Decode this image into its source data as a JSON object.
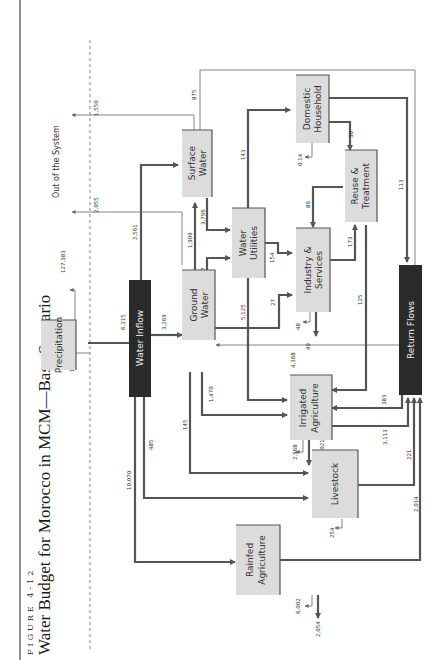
{
  "figure": {
    "label": "FIGURE 4-12",
    "title": "Water Budget for Morocco in MCM—Base Scenario"
  },
  "regions": {
    "out_of_system": "Out of the System"
  },
  "nodes": {
    "precipitation": "Precipitation",
    "water_inflow": "Water Inflow",
    "surface_water": [
      "Surface",
      "Water"
    ],
    "ground_water": [
      "Ground",
      "Water"
    ],
    "water_utilities": [
      "Water",
      "Utilities"
    ],
    "domestic_household": [
      "Domestic",
      "Household"
    ],
    "reuse_treatment": [
      "Reuse &",
      "Treatment"
    ],
    "industry_services": [
      "Industry &",
      "Services"
    ],
    "irrigated_agriculture": [
      "Irrigated",
      "Agriculture"
    ],
    "livestock": "Livestock",
    "rainfed_agriculture": [
      "Rainfed",
      "Agriculture"
    ],
    "return_flows": "Return Flows"
  },
  "flows": {
    "precip_in": "133,698",
    "precip_out": "127,383",
    "precip_to_inflow": "6,315",
    "inflow_to_ground": "3,269",
    "inflow_to_surface": "2,561",
    "inflow_to_irrigated": "485",
    "inflow_to_rainfed": "10,070",
    "surface_out": "1,550",
    "ground_out": "2,055",
    "surface_to_return": "875",
    "ground_to_surface": "1,909",
    "surface_to_utilities": "3,796",
    "ground_to_utilities": "1,627",
    "ground_to_industry": "27",
    "ground_to_irrigated": "1,470",
    "ground_to_livestock": "145",
    "utilities_to_domestic": "143",
    "utilities_to_industry": "154",
    "utilities_to_irrigated": "5,125",
    "return_to_ground": "4,368",
    "domestic_loss": "0.14",
    "domestic_to_reuse": "30",
    "domestic_to_return": "113",
    "reuse_to_industry": "89",
    "industry_to_reuse": "173",
    "reuse_to_irrigated": "125",
    "industry_loss_a": "48",
    "industry_loss_b": "49",
    "return_to_irrigated": "383",
    "irrigated_to_return": "3,113",
    "irrigated_loss_a": "2,968",
    "irrigated_loss_b": "1,021",
    "livestock_to_return": "221",
    "livestock_loss": "254",
    "rainfed_to_return": "2,014",
    "rainfed_loss_a": "6,002",
    "rainfed_loss_b": "2,054"
  }
}
